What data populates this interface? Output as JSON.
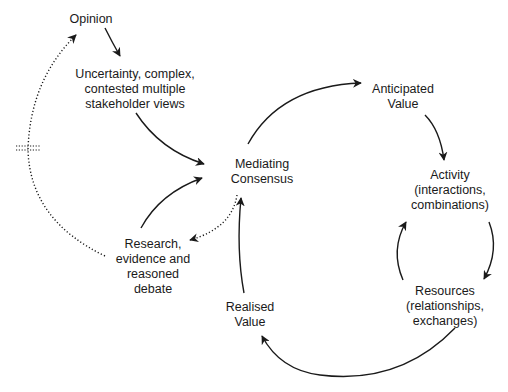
{
  "nodes": {
    "opinion": {
      "lines": [
        "Opinion"
      ],
      "x": 91,
      "y": 12
    },
    "uncertainty": {
      "lines": [
        "Uncertainty, complex,",
        "contested multiple",
        "stakeholder views"
      ],
      "x": 135,
      "y": 67
    },
    "mediating": {
      "lines": [
        "Mediating",
        "Consensus"
      ],
      "x": 262,
      "y": 155
    },
    "research": {
      "lines": [
        "Research,",
        "evidence and",
        "reasoned",
        "debate"
      ],
      "x": 153,
      "y": 236
    },
    "anticipated": {
      "lines": [
        "Anticipated",
        "Value"
      ],
      "x": 403,
      "y": 82
    },
    "activity": {
      "lines": [
        "Activity",
        "(interactions,",
        "combinations)"
      ],
      "x": 454,
      "y": 170
    },
    "resources": {
      "lines": [
        "Resources",
        "(relationships,",
        "exchanges)"
      ],
      "x": 454,
      "y": 283
    },
    "realised": {
      "lines": [
        "Realised",
        "Value"
      ],
      "x": 263,
      "y": 305
    }
  },
  "edges": [
    {
      "from": "opinion",
      "to": "uncertainty",
      "style": "solid"
    },
    {
      "from": "uncertainty",
      "to": "mediating",
      "style": "solid"
    },
    {
      "from": "research",
      "to": "mediating",
      "style": "solid"
    },
    {
      "from": "mediating",
      "to": "research",
      "style": "dotted"
    },
    {
      "from": "research",
      "to": "opinion",
      "style": "dotted",
      "delay_mark": true
    },
    {
      "from": "mediating",
      "to": "anticipated",
      "style": "solid"
    },
    {
      "from": "anticipated",
      "to": "activity",
      "style": "solid"
    },
    {
      "from": "activity",
      "to": "resources",
      "style": "solid"
    },
    {
      "from": "resources",
      "to": "activity",
      "style": "solid"
    },
    {
      "from": "resources",
      "to": "realised",
      "style": "solid"
    },
    {
      "from": "realised",
      "to": "mediating",
      "style": "solid"
    }
  ],
  "colors": {
    "stroke": "#1a1a1a",
    "text": "#1a1a1a",
    "background": "#ffffff"
  }
}
